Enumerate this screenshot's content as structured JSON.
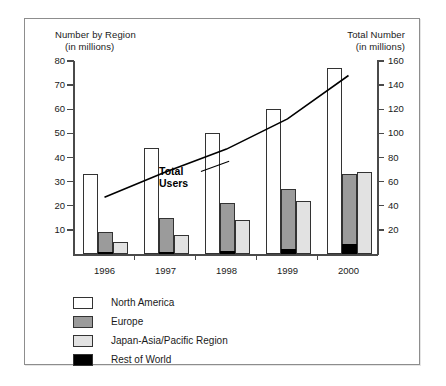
{
  "chart_data": {
    "type": "bar",
    "title": "",
    "subtitle": "",
    "categories": [
      "1996",
      "1997",
      "1998",
      "1999",
      "2000"
    ],
    "left_axis": {
      "label_line1": "Number by Region",
      "label_line2": "(in millions)",
      "ticks": [
        10,
        20,
        30,
        40,
        50,
        60,
        70,
        80
      ],
      "ylim": [
        0,
        80
      ]
    },
    "right_axis": {
      "label_line1": "Total Number",
      "label_line2": "(in millions)",
      "ticks": [
        20,
        40,
        60,
        80,
        100,
        120,
        140,
        160
      ],
      "ylim": [
        0,
        160
      ]
    },
    "grid": false,
    "legend_position": "bottom-left",
    "series": [
      {
        "name": "North America",
        "key": "na",
        "color": "#ffffff",
        "values": [
          33,
          44,
          50,
          60,
          77
        ]
      },
      {
        "name": "Europe",
        "key": "eu",
        "color": "#9b9b9b",
        "values": [
          9,
          15,
          21,
          27,
          33
        ]
      },
      {
        "name": "Japan-Asia/Pacific Region",
        "key": "jp",
        "color": "#e2e2e2",
        "values": [
          5,
          8,
          14,
          22,
          34
        ]
      },
      {
        "name": "Rest of World",
        "key": "row",
        "color": "#000000",
        "values": [
          0.6,
          0.9,
          1.3,
          2.2,
          4.2
        ]
      }
    ],
    "line_series": {
      "name": "Total Users",
      "axis": "right",
      "color": "#000000",
      "x": [
        "1996",
        "1997",
        "1998",
        "1999",
        "2000"
      ],
      "values": [
        47,
        68,
        87,
        112,
        148
      ]
    },
    "annotations": [
      {
        "name": "total-users-callout",
        "line1": "Total",
        "line2": "Users"
      }
    ]
  },
  "legend": {
    "items": [
      {
        "label": "North America",
        "swatch_class": "s-na",
        "icon": "legend-swatch-north-america"
      },
      {
        "label": "Europe",
        "swatch_class": "s-eu",
        "icon": "legend-swatch-europe"
      },
      {
        "label": "Japan-Asia/Pacific Region",
        "swatch_class": "s-jp",
        "icon": "legend-swatch-japan-asia-pacific"
      },
      {
        "label": "Rest of World",
        "swatch_class": "s-row",
        "icon": "legend-swatch-rest-of-world"
      }
    ]
  },
  "colors": {
    "north_america": "#ffffff",
    "europe": "#9b9b9b",
    "japan_asia_pacific": "#e2e2e2",
    "rest_of_world": "#000000",
    "axis": "#4a4a4a",
    "frame": "#8d8d8d",
    "text": "#1a1a1a"
  }
}
